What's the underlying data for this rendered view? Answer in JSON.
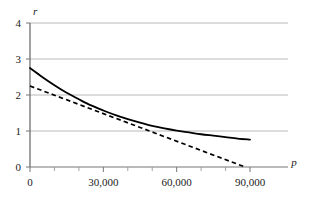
{
  "chart_data": {
    "type": "line",
    "title": "",
    "xlabel": "p",
    "ylabel": "r",
    "xlim": [
      0,
      95000
    ],
    "ylim": [
      0,
      4.3
    ],
    "grid": true,
    "grid_axis": "y",
    "legend": "none",
    "xticks": [
      0,
      30000,
      60000,
      90000
    ],
    "xticklabels": [
      "0",
      "30,000",
      "60,000",
      "90,000"
    ],
    "xminorticks": [
      10000,
      20000,
      40000,
      50000,
      70000,
      80000
    ],
    "yticks": [
      0,
      1,
      2,
      3,
      4
    ],
    "yticklabels": [
      "0",
      "1",
      "2",
      "3",
      "4"
    ],
    "series": [
      {
        "name": "solid-curve",
        "style": "solid",
        "color": "#000000",
        "x": [
          0,
          5000,
          10000,
          15000,
          20000,
          25000,
          30000,
          35000,
          40000,
          45000,
          50000,
          55000,
          60000,
          65000,
          70000,
          75000,
          80000,
          85000,
          90000
        ],
        "y": [
          2.75,
          2.5,
          2.27,
          2.06,
          1.88,
          1.71,
          1.57,
          1.44,
          1.33,
          1.23,
          1.14,
          1.07,
          1.01,
          0.96,
          0.91,
          0.87,
          0.83,
          0.79,
          0.76
        ]
      },
      {
        "name": "dashed-line",
        "style": "dashed",
        "color": "#000000",
        "x": [
          0,
          88000
        ],
        "y": [
          2.25,
          0.0
        ]
      }
    ],
    "annotations": {
      "crossing_points": [
        {
          "x": 10500,
          "y": 2.23
        },
        {
          "x": 50500,
          "y": 1.04
        }
      ]
    },
    "colors": {
      "axis": "#555555",
      "grid": "#b8b8b8",
      "curve": "#000000",
      "text": "#1a1a1a",
      "background": "#ffffff"
    }
  }
}
